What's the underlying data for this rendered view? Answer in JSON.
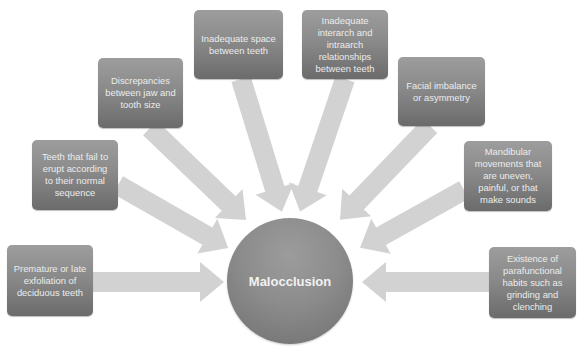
{
  "diagram": {
    "type": "hub-and-spoke",
    "center": {
      "label": "Malocclusion"
    },
    "causes": [
      {
        "id": "c1",
        "label": "Premature or late exfoliation of deciduous teeth"
      },
      {
        "id": "c2",
        "label": "Teeth that fail to erupt according to their normal sequence"
      },
      {
        "id": "c3",
        "label": "Discrepancies between jaw and tooth size"
      },
      {
        "id": "c4",
        "label": "Inadequate space between teeth"
      },
      {
        "id": "c5",
        "label": "Inadequate interarch and intraarch relationships between teeth"
      },
      {
        "id": "c6",
        "label": "Facial imbalance or asymmetry"
      },
      {
        "id": "c7",
        "label": "Mandibular movements that are uneven, painful, or that make sounds"
      },
      {
        "id": "c8",
        "label": "Existence of parafunctional habits such as grinding and clenching"
      }
    ],
    "colors": {
      "box_fill_top": "#9d9d9d",
      "box_fill_bottom": "#6b6b6b",
      "arrow_fill": "#d0d0d0",
      "text": "#ececec",
      "background": "#ffffff"
    }
  }
}
